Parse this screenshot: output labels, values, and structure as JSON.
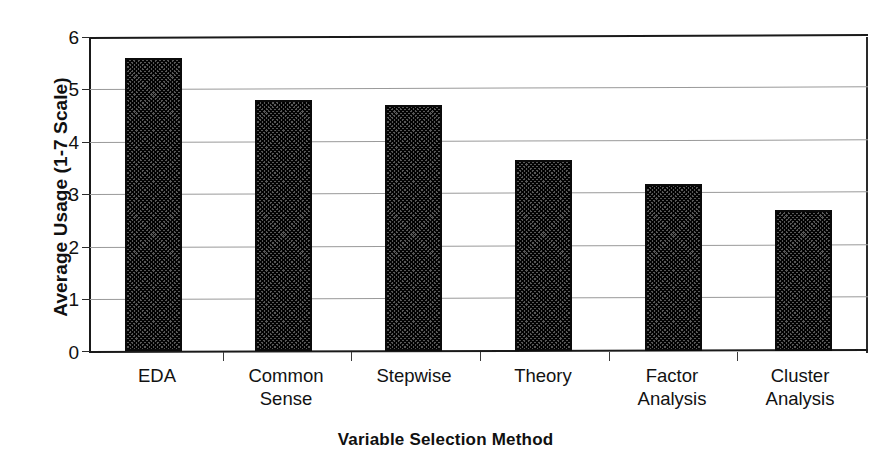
{
  "chart_data": {
    "type": "bar",
    "title": "",
    "xlabel": "Variable Selection Method",
    "ylabel": "Average Usage (1-7 Scale)",
    "categories": [
      "EDA",
      "Common Sense",
      "Stepwise",
      "Theory",
      "Factor Analysis",
      "Cluster Analysis"
    ],
    "category_lines": [
      [
        "EDA"
      ],
      [
        "Common",
        "Sense"
      ],
      [
        "Stepwise"
      ],
      [
        "Theory"
      ],
      [
        "Factor",
        "Analysis"
      ],
      [
        "Cluster",
        "Analysis"
      ]
    ],
    "values": [
      5.6,
      4.8,
      4.7,
      3.65,
      3.2,
      2.7
    ],
    "ylim": [
      0,
      6
    ],
    "yticks": [
      0,
      1,
      2,
      3,
      4,
      5,
      6
    ],
    "ytick_labels": [
      "0",
      "1",
      "2",
      "3",
      "4",
      "5",
      "6"
    ],
    "grid": true,
    "legend": "none",
    "bar_fill_color": "#585858",
    "bar_edge_color": "#0b0b0b",
    "gridline_color": "#9a9a9a",
    "axis_color": "#1a1a1a",
    "background_color": "#ffffff"
  }
}
